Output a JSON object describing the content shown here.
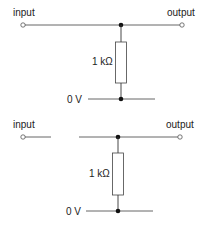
{
  "circuits": [
    {
      "name": "closed-circuit",
      "input_label": "input",
      "output_label": "output",
      "resistor_label": "1 kΩ",
      "ground_label": "0 V"
    },
    {
      "name": "open-circuit",
      "input_label": "input",
      "output_label": "output",
      "resistor_label": "1 kΩ",
      "ground_label": "0 V"
    }
  ],
  "colors": {
    "line": "#222222",
    "wire": "#666666"
  }
}
